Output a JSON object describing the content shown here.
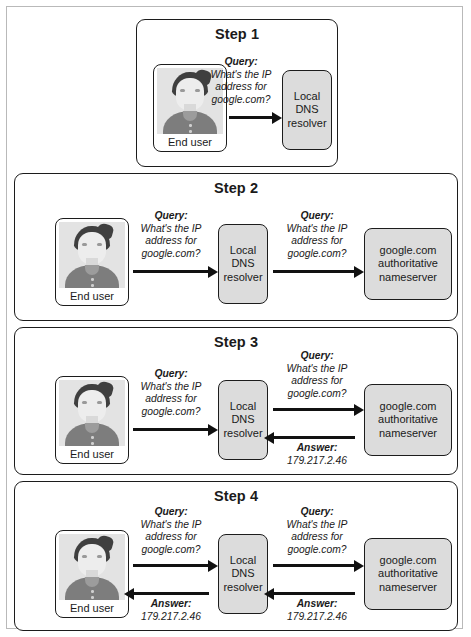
{
  "figure": {
    "node_labels": {
      "end_user": "End user",
      "resolver_line1": "Local",
      "resolver_line2": "DNS",
      "resolver_line3": "resolver",
      "nameserver_line1": "google.com",
      "nameserver_line2": "authoritative",
      "nameserver_line3": "nameserver"
    },
    "messages": {
      "query_title": "Query:",
      "query_line1": "What's the IP",
      "query_line2": "address for",
      "query_line3": "google.com?",
      "answer_title": "Answer:",
      "answer_value": "179.217.2.46"
    },
    "steps": [
      {
        "id": "step-1",
        "title": "Step 1"
      },
      {
        "id": "step-2",
        "title": "Step 2"
      },
      {
        "id": "step-3",
        "title": "Step 3"
      },
      {
        "id": "step-4",
        "title": "Step 4"
      }
    ]
  }
}
